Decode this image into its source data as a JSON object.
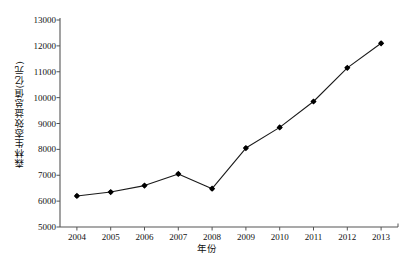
{
  "chart_data": {
    "type": "line",
    "title": "",
    "xlabel": "年份",
    "ylabel": "森林生态效益总值(亿元)",
    "categories": [
      "2004",
      "2005",
      "2006",
      "2007",
      "2008",
      "2009",
      "2010",
      "2011",
      "2012",
      "2013"
    ],
    "x": [
      2004,
      2005,
      2006,
      2007,
      2008,
      2009,
      2010,
      2011,
      2012,
      2013
    ],
    "values": [
      6200,
      6350,
      6600,
      7050,
      6480,
      8050,
      8850,
      9850,
      11150,
      12100
    ],
    "series": [
      {
        "name": "森林生态效益总值(亿元)",
        "values": [
          6200,
          6350,
          6600,
          7050,
          6480,
          8050,
          8850,
          9850,
          11150,
          12100
        ]
      }
    ],
    "ylim": [
      5000,
      13000
    ],
    "ytick_values": [
      5000,
      6000,
      7000,
      8000,
      9000,
      10000,
      11000,
      12000,
      13000
    ],
    "ytick_labels": [
      "5000",
      "6000",
      "7000",
      "8000",
      "9000",
      "10000",
      "11000",
      "12000",
      "13000"
    ],
    "xtick_labels": [
      "2004",
      "2005",
      "2006",
      "2007",
      "2008",
      "2009",
      "2010",
      "2011",
      "2012",
      "2013"
    ],
    "grid": false,
    "legend": false,
    "legend_position": "none",
    "marker": "filled-diamond",
    "line_color": "#1a1a1a",
    "marker_color": "#000000",
    "background_color": "#ffffff",
    "axis_color": "#555555"
  }
}
